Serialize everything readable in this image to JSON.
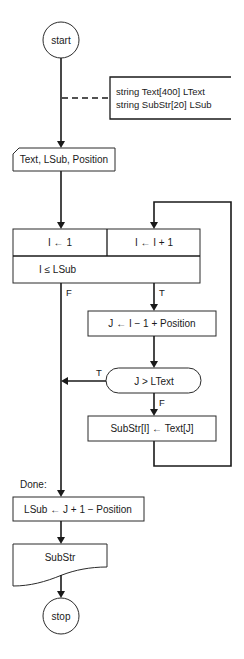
{
  "flowchart": {
    "start": {
      "label": "start"
    },
    "declaration": {
      "line1": "string Text[400] LText",
      "line2": "string SubStr[20] LSub"
    },
    "input": {
      "label": "Text, LSub, Position"
    },
    "loop": {
      "init": "I ← 1",
      "increment": "I ← I + 1",
      "condition": "I ≤ LSub",
      "false_label": "F",
      "true_label": "T"
    },
    "compute_j": {
      "label": "J ← I − 1 + Position"
    },
    "decision": {
      "label": "J > LText",
      "true_label": "T",
      "false_label": "F"
    },
    "assign": {
      "label": "SubStr[I] ← Text[J]"
    },
    "done_label": "Done:",
    "compute_lsub": {
      "label": "LSub ← J + 1 − Position"
    },
    "output": {
      "label": "SubStr"
    },
    "stop": {
      "label": "stop"
    }
  }
}
